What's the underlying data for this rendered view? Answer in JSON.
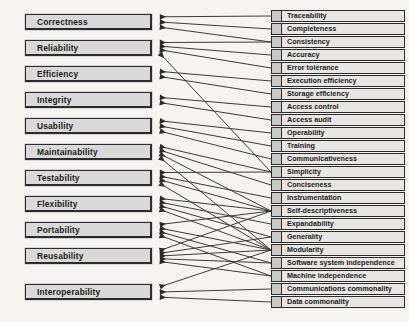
{
  "diagram": {
    "type": "mapping-diagram",
    "background_color": "#f6f4f1",
    "box_fill_color": "#d9d9d9",
    "row_fill_color": "#e8e6e3",
    "line_color": "#3a3a3a",
    "factor_count": 11,
    "criterion_count": 23
  },
  "factors": [
    {
      "id": "correctness",
      "label": "Correctness",
      "y": 14
    },
    {
      "id": "reliability",
      "label": "Reliability",
      "y": 40
    },
    {
      "id": "efficiency",
      "label": "Efficiency",
      "y": 66
    },
    {
      "id": "integrity",
      "label": "Integrity",
      "y": 92
    },
    {
      "id": "usability",
      "label": "Usability",
      "y": 118
    },
    {
      "id": "maintainability",
      "label": "Maintainability",
      "y": 144
    },
    {
      "id": "testability",
      "label": "Testability",
      "y": 170
    },
    {
      "id": "flexibility",
      "label": "Flexibility",
      "y": 196
    },
    {
      "id": "portability",
      "label": "Portability",
      "y": 222
    },
    {
      "id": "reusability",
      "label": "Reusability",
      "y": 248
    },
    {
      "id": "interoperability",
      "label": "Interoperability",
      "y": 284
    }
  ],
  "criteria": [
    {
      "id": "traceability",
      "label": "Traceability",
      "y": 10
    },
    {
      "id": "completeness",
      "label": "Completeness",
      "y": 23
    },
    {
      "id": "consistency",
      "label": "Consistency",
      "y": 36
    },
    {
      "id": "accuracy",
      "label": "Accuracy",
      "y": 49
    },
    {
      "id": "error-tolerance",
      "label": "Error tolerance",
      "y": 62
    },
    {
      "id": "execution-efficiency",
      "label": "Execution efficiency",
      "y": 75
    },
    {
      "id": "storage-efficiency",
      "label": "Storage efficiency",
      "y": 88
    },
    {
      "id": "access-control",
      "label": "Access control",
      "y": 101
    },
    {
      "id": "access-audit",
      "label": "Access audit",
      "y": 114
    },
    {
      "id": "operability",
      "label": "Operability",
      "y": 127
    },
    {
      "id": "training",
      "label": "Training",
      "y": 140
    },
    {
      "id": "communicativeness",
      "label": "Communicativeness",
      "y": 153
    },
    {
      "id": "simplicity",
      "label": "Simplicity",
      "y": 166
    },
    {
      "id": "conciseness",
      "label": "Conciseness",
      "y": 179
    },
    {
      "id": "instrumentation",
      "label": "Instrumentation",
      "y": 192
    },
    {
      "id": "self-descriptiveness",
      "label": "Self-descriptiveness",
      "y": 205
    },
    {
      "id": "expandability",
      "label": "Expandability",
      "y": 218
    },
    {
      "id": "generality",
      "label": "Generality",
      "y": 231
    },
    {
      "id": "modularity",
      "label": "Modularity",
      "y": 244
    },
    {
      "id": "software-system-independence",
      "label": "Software system independence",
      "y": 257
    },
    {
      "id": "machine-independence",
      "label": "Machine independence",
      "y": 270
    },
    {
      "id": "communications-commonality",
      "label": "Communications commonality",
      "y": 283
    },
    {
      "id": "data-commonality",
      "label": "Data commonality",
      "y": 296
    }
  ],
  "edges": [
    {
      "from": "correctness",
      "to": "traceability"
    },
    {
      "from": "correctness",
      "to": "completeness"
    },
    {
      "from": "correctness",
      "to": "consistency"
    },
    {
      "from": "reliability",
      "to": "consistency"
    },
    {
      "from": "reliability",
      "to": "accuracy"
    },
    {
      "from": "reliability",
      "to": "error-tolerance"
    },
    {
      "from": "reliability",
      "to": "simplicity"
    },
    {
      "from": "efficiency",
      "to": "execution-efficiency"
    },
    {
      "from": "efficiency",
      "to": "storage-efficiency"
    },
    {
      "from": "integrity",
      "to": "access-control"
    },
    {
      "from": "integrity",
      "to": "access-audit"
    },
    {
      "from": "usability",
      "to": "operability"
    },
    {
      "from": "usability",
      "to": "training"
    },
    {
      "from": "usability",
      "to": "communicativeness"
    },
    {
      "from": "maintainability",
      "to": "simplicity"
    },
    {
      "from": "maintainability",
      "to": "conciseness"
    },
    {
      "from": "maintainability",
      "to": "self-descriptiveness"
    },
    {
      "from": "maintainability",
      "to": "modularity"
    },
    {
      "from": "testability",
      "to": "simplicity"
    },
    {
      "from": "testability",
      "to": "instrumentation"
    },
    {
      "from": "testability",
      "to": "self-descriptiveness"
    },
    {
      "from": "testability",
      "to": "modularity"
    },
    {
      "from": "flexibility",
      "to": "self-descriptiveness"
    },
    {
      "from": "flexibility",
      "to": "expandability"
    },
    {
      "from": "flexibility",
      "to": "generality"
    },
    {
      "from": "flexibility",
      "to": "modularity"
    },
    {
      "from": "portability",
      "to": "self-descriptiveness"
    },
    {
      "from": "portability",
      "to": "modularity"
    },
    {
      "from": "portability",
      "to": "software-system-independence"
    },
    {
      "from": "portability",
      "to": "machine-independence"
    },
    {
      "from": "reusability",
      "to": "self-descriptiveness"
    },
    {
      "from": "reusability",
      "to": "generality"
    },
    {
      "from": "reusability",
      "to": "modularity"
    },
    {
      "from": "reusability",
      "to": "software-system-independence"
    },
    {
      "from": "reusability",
      "to": "machine-independence"
    },
    {
      "from": "interoperability",
      "to": "modularity"
    },
    {
      "from": "interoperability",
      "to": "communications-commonality"
    },
    {
      "from": "interoperability",
      "to": "data-commonality"
    }
  ]
}
